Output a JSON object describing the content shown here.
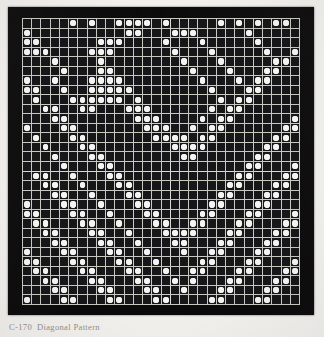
{
  "figure": {
    "caption_id": "C-170",
    "caption_title": "Diagonal Pattern",
    "caption_full": "C-170  Diagonal Pattern",
    "medium": "halftone scan of printed pattern plate"
  },
  "colors": {
    "page_background": "#f2f1ee",
    "plate_background": "#0a0a0a",
    "cell_background": "#17171a",
    "gridline": "#c9c9c4",
    "block_separator": "#d8d8d4",
    "dot_fill": "#f4f4f2",
    "caption_text": "#6e6c68"
  },
  "chart_data": {
    "type": "heatmap",
    "xlabel": "",
    "ylabel": "",
    "rows": 30,
    "cols": 30,
    "value_legend": {
      "0": "empty dark cell",
      "1": "white dot"
    },
    "block_separators": {
      "columns_after": [
        15
      ],
      "rows_after": [
        15
      ]
    },
    "matrix": [
      "000001010011110100000101010110000",
      "100000000001100011100000100000011",
      "110000001110000100010000010000110",
      "111000011100000010001000001001100",
      "000100001000000001000100000110001",
      "000010001100000000100010001100000",
      "100100011110000000010001011000000",
      "110010011111000000001000110000001",
      "010001111110100000000101100000011",
      "001100110001110000001011000000110",
      "000110000000111000010110000001100",
      "100011000000011100101100000011000",
      "010001100000001111011000000110001",
      "001000110000000011110000001100011",
      "000100011000000001100000011000110",
      "000010001100000000000000110001100",
      "011001000110000000000001100011000",
      "001100100011000000000011000110001",
      "000110010001100000000110001100011",
      "100011001000110000001100011000110",
      "110001100100011000011000110001100",
      "011000110010001100110001100011000",
      "001100011001000111100011000110001",
      "000110001100100011000110001100011",
      "100011000110010001001100011000110",
      "110001100011001000011000110001100",
      "011000110001100100110001100011000",
      "001100011000110010100011000110001",
      "000110001100011001000110001100011",
      "100011000110001100001100011000110"
    ]
  }
}
